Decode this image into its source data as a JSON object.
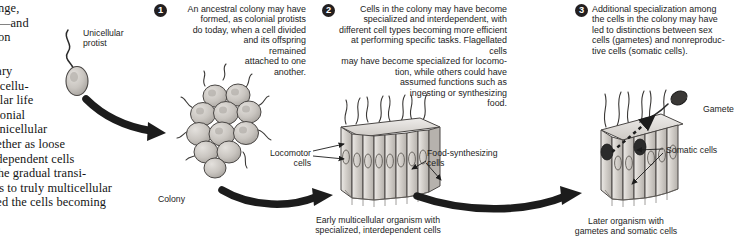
{
  "figure": {
    "ink": "#231f20",
    "cell_fill": "#c9c6c2",
    "cell_fill_light": "#ddd9d4",
    "nucleus": "#2b2b2b"
  },
  "body_text": {
    "fragment_top": "nge,\n—and\non",
    "fragment_bottom": "nary\nnicellu-\nlular life\nolonial\n unicellular\ngether as loose\nndependent cells\nThe gradual transi-\nies to truly multicellular\nved the cells becoming"
  },
  "steps": [
    {
      "number": "1",
      "text": "An ancestral colony may have\nformed, as colonial protists\ndo today, when a cell divided\nand its offspring\nremained\nattached to one\nanother."
    },
    {
      "number": "2",
      "text": "Cells in the colony may have become\nspecialized and interdependent, with\ndifferent cell types becoming more efficient\nat performing specific tasks. Flagellated cells\nmay have become specialized for locomo-\ntion, while others could have\nassumed functions such as\ningesting or synthesizing\nfood."
    },
    {
      "number": "3",
      "text": "Additional specialization among\nthe cells in the colony may have\nled to distinctions between sex\ncells (gametes) and nonreproduc-\ntive cells (somatic cells)."
    }
  ],
  "labels": {
    "unicellular_protist": "Unicellular\nprotist",
    "colony": "Colony",
    "locomotor_cells": "Locomotor\ncells",
    "food_synthesizing_cells": "Food-synthesizing\ncells",
    "gamete": "Gamete",
    "somatic_cells": "Somatic cells"
  },
  "captions": {
    "early_organism": "Early multicellular organism with\nspecialized, interdependent cells",
    "later_organism": "Later organism with\ngametes and somatic cells"
  }
}
